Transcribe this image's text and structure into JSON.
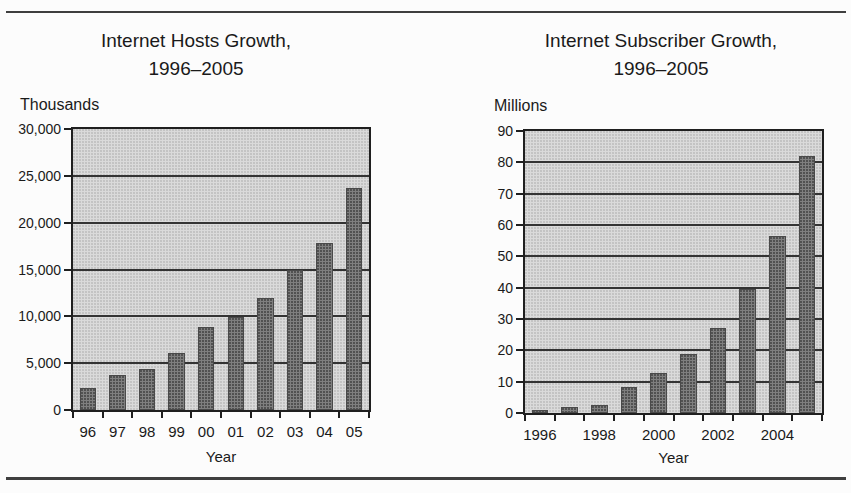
{
  "colors": {
    "bar_fill": "#7f7f7f",
    "bar_border": "#4a4a4a",
    "plot_background": "#dadada",
    "gridline": "#333333",
    "axis_frame": "#1f1f1f",
    "text": "#1a1a1a",
    "page_background": "#fcfcfc",
    "rule": "#3f3f3f"
  },
  "chart_data": [
    {
      "type": "bar",
      "title": "Internet Hosts Growth, 1996–2005",
      "title_lines": [
        "Internet Hosts Growth,",
        "1996–2005"
      ],
      "ylabel": "Thousands",
      "xlabel": "Year",
      "categories": [
        "96",
        "97",
        "98",
        "99",
        "00",
        "01",
        "02",
        "03",
        "04",
        "05"
      ],
      "values": [
        2300,
        3700,
        4400,
        6100,
        8900,
        9900,
        12000,
        14900,
        17800,
        23700
      ],
      "ylim": [
        0,
        30000
      ],
      "ytick_step": 5000,
      "ytick_labels": [
        "0",
        "5,000",
        "10,000",
        "15,000",
        "20,000",
        "25,000",
        "30,000"
      ],
      "xtick_labels": [
        "96",
        "97",
        "98",
        "99",
        "00",
        "01",
        "02",
        "03",
        "04",
        "05"
      ],
      "grid": true,
      "legend": "none"
    },
    {
      "type": "bar",
      "title": "Internet Subscriber Growth, 1996–2005",
      "title_lines": [
        "Internet Subscriber Growth,",
        "1996–2005"
      ],
      "ylabel": "Millions",
      "xlabel": "Year",
      "categories": [
        "1996",
        "1997",
        "1998",
        "1999",
        "2000",
        "2001",
        "2002",
        "2003",
        "2004",
        "2005"
      ],
      "values": [
        1.0,
        1.9,
        2.6,
        8.2,
        12.8,
        18.8,
        27.0,
        39.5,
        56.5,
        82.0
      ],
      "ylim": [
        0,
        90
      ],
      "ytick_step": 10,
      "ytick_labels": [
        "0",
        "10",
        "20",
        "30",
        "40",
        "50",
        "60",
        "70",
        "80",
        "90"
      ],
      "xtick_labels": [
        "1996",
        "",
        "1998",
        "",
        "2000",
        "",
        "2002",
        "",
        "2004",
        ""
      ],
      "grid": true,
      "legend": "none"
    }
  ]
}
